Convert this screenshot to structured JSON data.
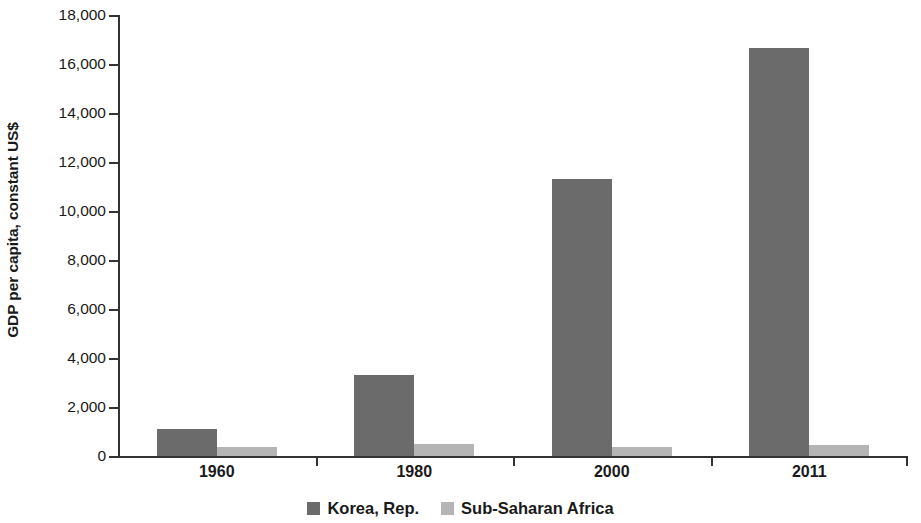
{
  "chart_data": {
    "type": "bar",
    "title": "",
    "subtitle": "",
    "xlabel": "",
    "ylabel": "GDP per capita, constant US$",
    "categories": [
      "1960",
      "1980",
      "2000",
      "2011"
    ],
    "series": [
      {
        "name": "Korea, Rep.",
        "color": "#6b6b6b",
        "values": [
          1100,
          3300,
          11300,
          16650
        ]
      },
      {
        "name": "Sub-Saharan Africa",
        "color": "#b5b5b5",
        "values": [
          370,
          500,
          370,
          450
        ]
      }
    ],
    "ylim": [
      0,
      18000
    ],
    "yticks": [
      0,
      2000,
      4000,
      6000,
      8000,
      10000,
      12000,
      14000,
      16000,
      18000
    ],
    "ytick_labels": [
      "0",
      "2,000",
      "4,000",
      "6,000",
      "8,000",
      "10,000",
      "12,000",
      "14,000",
      "16,000",
      "18,000"
    ],
    "grid": false,
    "legend_position": "bottom",
    "annotations": []
  },
  "axis": {
    "y_title": "GDP per capita, constant US$"
  },
  "legend": {
    "items": [
      {
        "label": "Korea, Rep."
      },
      {
        "label": "Sub-Saharan Africa"
      }
    ]
  }
}
